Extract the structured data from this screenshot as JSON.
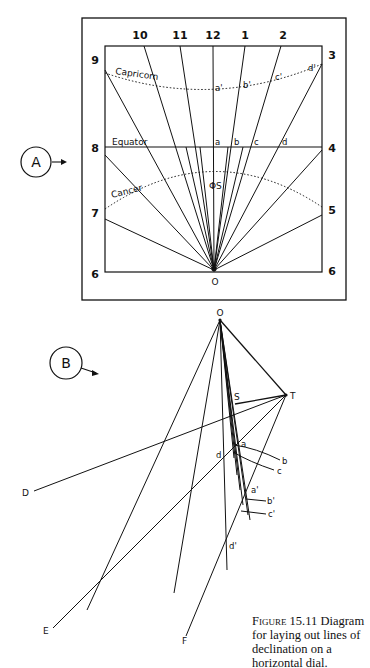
{
  "figure": {
    "caption_label": "Figure 15.11",
    "caption_text": "Diagram for laying out lines of declination on a horizontal dial."
  },
  "part_a": {
    "marker": "A",
    "hour_labels_top": [
      "10",
      "11",
      "12",
      "1",
      "2"
    ],
    "hour_labels_left": [
      "9",
      "8",
      "7",
      "6"
    ],
    "hour_labels_right": [
      "3",
      "4",
      "5",
      "6"
    ],
    "curve_labels": {
      "capricorn": "Capricorn",
      "equator": "Equator",
      "cancer": "Cancer"
    },
    "equator_points": [
      "a",
      "b",
      "c",
      "d"
    ],
    "capricorn_points": [
      "a'",
      "b'",
      "c'",
      "d'"
    ],
    "style_point": "ΦS",
    "origin": "O"
  },
  "part_b": {
    "marker": "B",
    "apex": "O",
    "points": {
      "T": "T",
      "S": "S",
      "D": "D",
      "E": "E",
      "F": "F"
    },
    "equator_points": [
      "a",
      "b",
      "c",
      "d"
    ],
    "capricorn_points": [
      "a'",
      "b'",
      "c'",
      "d'"
    ]
  }
}
